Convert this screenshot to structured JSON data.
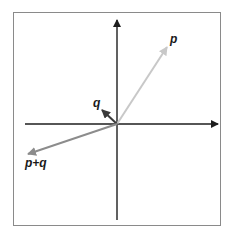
{
  "diagram": {
    "origin": [
      117,
      124
    ],
    "axes": {
      "color": "#1e1e1e",
      "x_axis": {
        "from": [
          25,
          124
        ],
        "to": [
          218,
          124
        ]
      },
      "y_axis": {
        "from": [
          117,
          220
        ],
        "to": [
          117,
          20
        ]
      }
    },
    "vectors": [
      {
        "name": "p",
        "label": "p",
        "tip": [
          167,
          47
        ],
        "color": "#c8c8c8",
        "label_pos": [
          170,
          33
        ]
      },
      {
        "name": "q",
        "label": "q",
        "tip": [
          102,
          110
        ],
        "color": "#3a3a3a",
        "label_pos": [
          93,
          97
        ]
      },
      {
        "name": "p+q",
        "label": "p+q",
        "tip": [
          28,
          154
        ],
        "color": "#8c8c8c",
        "label_pos": [
          25,
          157
        ]
      }
    ]
  }
}
